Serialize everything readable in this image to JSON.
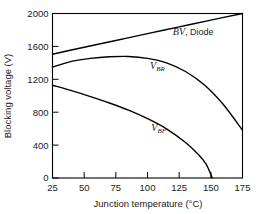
{
  "chart_data": {
    "type": "line",
    "title": "",
    "xlabel": "Junction temperature (°C)",
    "ylabel": "Blocking voltage (V)",
    "xlim": [
      25,
      175
    ],
    "ylim": [
      0,
      2000
    ],
    "xticks": [
      25,
      50,
      75,
      100,
      125,
      150,
      175
    ],
    "yticks": [
      0,
      400,
      800,
      1200,
      1600,
      2000
    ],
    "xtick_labels": [
      "25",
      "50",
      "75",
      "100",
      "125",
      "150",
      "175"
    ],
    "ytick_labels": [
      "0",
      "400",
      "800",
      "1200",
      "1600",
      "2000"
    ],
    "grid": false,
    "legend": "inline-annotations",
    "series": [
      {
        "name": "BV, Diode",
        "label_html": "<tspan class=\"ital\">BV</tspan><tspan class=\"plain\">, Diode</tspan>",
        "label_x": 120,
        "label_y": 1735,
        "x": [
          25,
          50,
          75,
          100,
          125,
          150,
          175
        ],
        "values": [
          1505,
          1590,
          1672,
          1755,
          1838,
          1920,
          2000
        ]
      },
      {
        "name": "V_BR",
        "label_html": "<tspan class=\"ital\">V</tspan><tspan class=\"sub\" dy=\"2\">BR</tspan>",
        "label_x": 102,
        "label_y": 1330,
        "x": [
          25,
          40,
          55,
          70,
          85,
          100,
          115,
          130,
          145,
          160,
          175
        ],
        "values": [
          1350,
          1418,
          1455,
          1474,
          1478,
          1455,
          1400,
          1295,
          1130,
          890,
          580
        ]
      },
      {
        "name": "V_BF",
        "label_html": "<tspan class=\"ital\">V</tspan><tspan class=\"sub\" dy=\"2\">BF</tspan>",
        "label_x": 103,
        "label_y": 570,
        "x": [
          25,
          40,
          55,
          70,
          85,
          100,
          115,
          130,
          140,
          146,
          150,
          151
        ],
        "values": [
          1128,
          1062,
          990,
          912,
          825,
          722,
          598,
          432,
          290,
          175,
          45,
          0
        ]
      }
    ],
    "colors": {
      "axis": "#000000",
      "curve": "#000000",
      "background": "#ffffff",
      "text": "#1a1a1a"
    }
  }
}
